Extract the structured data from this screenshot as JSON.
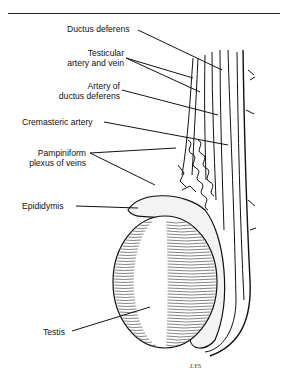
{
  "figure": {
    "labels": {
      "ductus_deferens": "Ductus deferens",
      "testicular_1": "Testicular",
      "testicular_2": "artery and vein",
      "artery_of_1": "Artery of",
      "artery_of_2": "ductus deferens",
      "cremasteric": "Cremasteric artery",
      "pampiniform_1": "Pampiniform",
      "pampiniform_2": "plexus of veins",
      "epididymis": "Epididymis",
      "testis": "Testis"
    },
    "signature": "LYS"
  }
}
